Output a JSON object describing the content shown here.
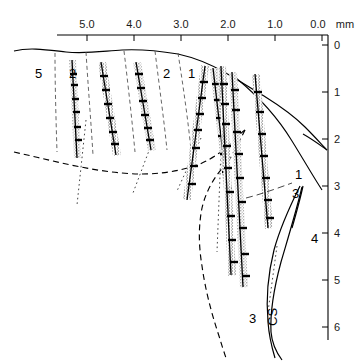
{
  "figure": {
    "units_label": "mm",
    "background": "#ffffff",
    "ink": "#000000"
  },
  "top_axis": {
    "name": "horizontal-scale-mm",
    "unit_suffix": "mm",
    "ticks": [
      {
        "label": "5.0",
        "x": 87
      },
      {
        "label": "4.0",
        "x": 134
      },
      {
        "label": "3.0",
        "x": 181
      },
      {
        "label": "2.0",
        "x": 228
      },
      {
        "label": "1.0",
        "x": 275
      },
      {
        "label": "0.0",
        "x": 322
      }
    ],
    "line": {
      "x1": 57,
      "x2": 328,
      "y": 35
    }
  },
  "right_axis": {
    "name": "vertical-depth-mm",
    "ticks": [
      {
        "label": "0",
        "y": 45
      },
      {
        "label": "1",
        "y": 92
      },
      {
        "label": "2",
        "y": 139
      },
      {
        "label": "3",
        "y": 186
      },
      {
        "label": "4",
        "y": 233
      },
      {
        "label": "5",
        "y": 280
      },
      {
        "label": "6",
        "y": 327
      }
    ],
    "line": {
      "x": 328,
      "y1": 35,
      "y2": 340
    }
  },
  "region_labels": [
    {
      "id": "area-5",
      "text": "5",
      "x": 35,
      "y": 78
    },
    {
      "id": "area-2-left",
      "text": "2",
      "x": 69,
      "y": 78
    },
    {
      "id": "area-2-right",
      "text": "2",
      "x": 163,
      "y": 78
    },
    {
      "id": "area-1-top",
      "text": "1",
      "x": 188,
      "y": 78
    },
    {
      "id": "area-1-lower",
      "text": "1",
      "x": 295,
      "y": 179
    },
    {
      "id": "area-3-upper",
      "text": "3",
      "x": 292,
      "y": 198
    },
    {
      "id": "area-4",
      "text": "4",
      "x": 311,
      "y": 243
    },
    {
      "id": "area-3-lower",
      "text": "3",
      "x": 249,
      "y": 323
    },
    {
      "id": "central-sulcus",
      "text": "CS",
      "x": 277,
      "y": 326,
      "rotated": true
    }
  ],
  "tracks": [
    {
      "id": "track-1",
      "x1": 72,
      "y1": 60,
      "x2": 77,
      "y2": 158
    },
    {
      "id": "track-2",
      "x1": 101,
      "y1": 62,
      "x2": 116,
      "y2": 155
    },
    {
      "id": "track-3",
      "x1": 136,
      "y1": 62,
      "x2": 151,
      "y2": 150
    },
    {
      "id": "track-4",
      "x1": 205,
      "y1": 66,
      "x2": 187,
      "y2": 200
    },
    {
      "id": "track-5",
      "x1": 213,
      "y1": 68,
      "x2": 228,
      "y2": 197
    },
    {
      "id": "track-6",
      "x1": 221,
      "y1": 66,
      "x2": 231,
      "y2": 275
    },
    {
      "id": "track-7",
      "x1": 232,
      "y1": 72,
      "x2": 243,
      "y2": 287
    },
    {
      "id": "track-8",
      "x1": 255,
      "y1": 74,
      "x2": 268,
      "y2": 228
    },
    {
      "id": "track-9",
      "x1": 259,
      "y1": 180,
      "x2": 264,
      "y2": 232
    }
  ],
  "lamina_boundaries": [
    {
      "id": "bnd-5-2",
      "x1": 55,
      "y1": 53,
      "x2": 57,
      "y2": 152
    },
    {
      "id": "bnd-2-a",
      "x1": 86,
      "y1": 52,
      "x2": 93,
      "y2": 155
    },
    {
      "id": "bnd-2-b",
      "x1": 124,
      "y1": 51,
      "x2": 135,
      "y2": 152
    },
    {
      "id": "bnd-2-c",
      "x1": 155,
      "y1": 51,
      "x2": 167,
      "y2": 150
    },
    {
      "id": "bnd-2-1",
      "x1": 178,
      "y1": 53,
      "x2": 191,
      "y2": 150
    }
  ],
  "dotted_rays": [
    {
      "id": "ray-1",
      "x1": 86,
      "y1": 120,
      "x2": 77,
      "y2": 205
    },
    {
      "id": "ray-2",
      "x1": 149,
      "y1": 150,
      "x2": 133,
      "y2": 192
    },
    {
      "id": "ray-3",
      "x1": 200,
      "y1": 140,
      "x2": 177,
      "y2": 190
    },
    {
      "id": "ray-4",
      "x1": 222,
      "y1": 150,
      "x2": 217,
      "y2": 250
    },
    {
      "id": "ray-5",
      "x1": 277,
      "y1": 248,
      "x2": 268,
      "y2": 310
    }
  ],
  "outline": {
    "id": "cortex-outline",
    "description": "pial surface of the cortical block, sloping to the right and curving down to the vertical axis"
  },
  "dashed_boundary": {
    "id": "white-matter-boundary",
    "description": "dashed grey/white-matter border crossing the section and descending at lower left"
  },
  "sulcus_curves": {
    "id": "central-sulcus-walls",
    "description": "two solid curves forming the central sulcus, labelled CS"
  }
}
